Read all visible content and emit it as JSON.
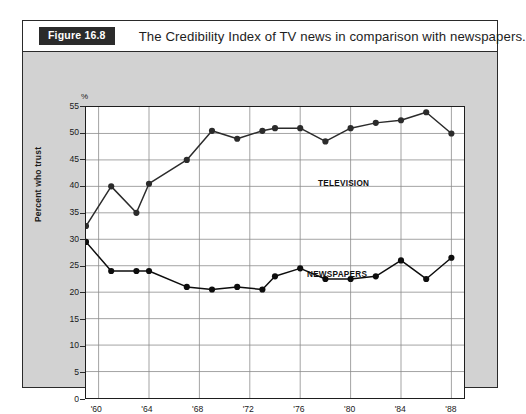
{
  "figure": {
    "number_label": "Figure 16.8",
    "caption": "The Credibility Index of TV news in comparison with newspapers."
  },
  "axes": {
    "y_title": "Percent who trust",
    "percent_symbol": "%",
    "y_ticks": [
      "55",
      "50",
      "45",
      "40",
      "35",
      "30",
      "25",
      "20",
      "15",
      "10",
      "5",
      "0"
    ],
    "x_ticks": [
      "'60",
      "'64",
      "'68",
      "'72",
      "'76",
      "'80",
      "'84",
      "'88"
    ]
  },
  "series_labels": {
    "television": "TELEVISION",
    "newspapers": "NEWSPAPERS"
  },
  "chart_data": {
    "type": "line",
    "title": "The Credibility Index of TV news in comparison with newspapers.",
    "xlabel": "",
    "ylabel": "Percent who trust",
    "ylim": [
      0,
      55
    ],
    "xlim": [
      1959,
      1989
    ],
    "grid": true,
    "legend_position": "inline-annotation",
    "y_unit": "%",
    "y_ticks": [
      0,
      5,
      10,
      15,
      20,
      25,
      30,
      35,
      40,
      45,
      50,
      55
    ],
    "x_ticks": [
      1960,
      1964,
      1968,
      1972,
      1976,
      1980,
      1984,
      1988
    ],
    "x_tick_labels": [
      "'60",
      "'64",
      "'68",
      "'72",
      "'76",
      "'80",
      "'84",
      "'88"
    ],
    "series": [
      {
        "name": "TELEVISION",
        "color": "#2b2b2b",
        "x": [
          1959,
          1961,
          1963,
          1964,
          1967,
          1969,
          1971,
          1973,
          1974,
          1976,
          1978,
          1980,
          1982,
          1984,
          1986,
          1988
        ],
        "values": [
          32.5,
          40,
          35,
          40.5,
          45,
          50.5,
          49,
          50.5,
          51,
          51,
          48.5,
          51,
          52,
          52.5,
          54,
          50
        ]
      },
      {
        "name": "NEWSPAPERS",
        "color": "#0d0d0d",
        "x": [
          1959,
          1961,
          1963,
          1964,
          1967,
          1969,
          1971,
          1973,
          1974,
          1976,
          1978,
          1980,
          1982,
          1984,
          1986,
          1988
        ],
        "values": [
          29.5,
          24,
          24,
          24,
          21,
          20.5,
          21,
          20.5,
          23,
          24.5,
          22.5,
          22.5,
          23,
          26,
          22.5,
          26.5
        ]
      }
    ]
  }
}
